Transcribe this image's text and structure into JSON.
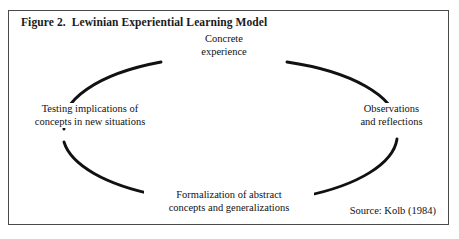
{
  "figure": {
    "title": "Figure 2.  Lewinian Experiential Learning Model",
    "source": "Source: Kolb (1984)",
    "border_color": "#4a4a4a",
    "background_color": "#ffffff",
    "stroke_color": "#111111"
  },
  "diagram": {
    "type": "cycle",
    "shape": "ellipse",
    "direction": "clockwise",
    "nodes": [
      {
        "id": "concrete-experience",
        "position": "top",
        "line1": "Concrete",
        "line2": "experience"
      },
      {
        "id": "observations-reflections",
        "position": "right",
        "line1": "Observations",
        "line2": "and reflections"
      },
      {
        "id": "formalization",
        "position": "bottom",
        "line1": "Formalization of abstract",
        "line2": "concepts and generalizations"
      },
      {
        "id": "testing-implications",
        "position": "left",
        "line1": "Testing implications of",
        "line2": "concepts in new situations"
      }
    ]
  }
}
